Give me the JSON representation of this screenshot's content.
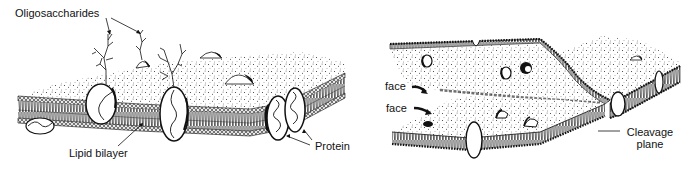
{
  "figure": {
    "left_panel": {
      "title": "Cell membrane structure",
      "labels": {
        "oligosaccharides": "Oligosaccharides",
        "lipid_bilayer": "Lipid bilayer",
        "protein": "Protein"
      }
    },
    "right_panel": {
      "title": "Freeze-fracture of membrane",
      "labels": {
        "face_upper": "face",
        "face_lower": "face",
        "cleavage_line1": "Cleavage",
        "cleavage_line2": "plane"
      }
    }
  },
  "colors": {
    "ink": "#111111",
    "background": "#ffffff",
    "stipple": "#444444"
  }
}
